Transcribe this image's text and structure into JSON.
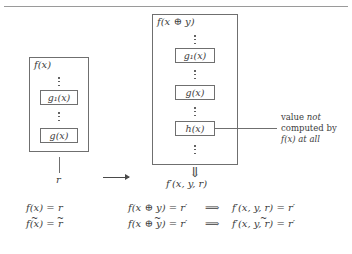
{
  "figure": {
    "left_diagram": {
      "outer_label": "f(x)",
      "inner_boxes": [
        {
          "label": "g₁(x)"
        },
        {
          "label": "g(x)"
        }
      ],
      "output_label": "r"
    },
    "transform_arrow": "⟶",
    "right_diagram": {
      "outer_label": "f(x ⊕ y)",
      "inner_boxes": [
        {
          "label": "g₁(x)"
        },
        {
          "label": "g(x)"
        },
        {
          "label": "h(x)"
        }
      ],
      "output_arrow": "⇓",
      "output_label": "f′(x, y, r)"
    },
    "annotation": {
      "line1_a": "value ",
      "line1_b": "not",
      "line2": "computed by",
      "line3_a": "f(x)",
      "line3_b": " at all"
    },
    "equations": {
      "left": [
        {
          "lhs": "f(x)",
          "rel": " = ",
          "rhs": "r",
          "lhs_tilde": false,
          "rhs_tilde": false
        },
        {
          "lhs": "f(x)",
          "rel": " = ",
          "rhs": "r",
          "lhs_tilde": true,
          "rhs_tilde": true
        }
      ],
      "middle": [
        {
          "text": "f(x ⊕ y) = r′"
        },
        {
          "text": "f(x ⊕ y) = r′"
        }
      ],
      "implies": "⟹",
      "right": [
        {
          "text": "f′(x, y, r) = r′"
        },
        {
          "text": "f′(x, y, r) = r′"
        }
      ]
    },
    "colors": {
      "ink": "#3d3d3d",
      "rule": "#6f6f6f",
      "background": "#ffffff"
    }
  }
}
